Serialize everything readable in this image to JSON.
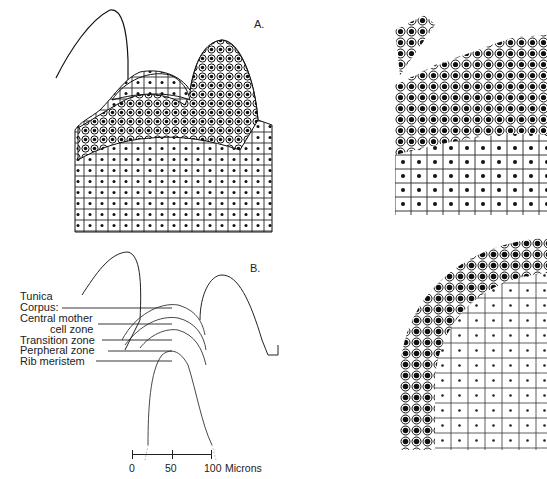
{
  "figure": {
    "panels": [
      {
        "id": "A",
        "label": "A.",
        "description": "Drawing of shoot apex section with cellular detail"
      },
      {
        "id": "B",
        "label": "B.",
        "description": "Outline diagram of shoot apex zones"
      }
    ],
    "zone_labels": [
      "Tunica",
      "Corpus:",
      "Central mother",
      "cell zone",
      "Transition zone",
      "Perpheral zone",
      "Rib meristem"
    ],
    "scale_bar": {
      "ticks": [
        "0",
        "50",
        "100"
      ],
      "unit": "Microns"
    },
    "right_panels": [
      {
        "id": "top-right",
        "description": "Enlarged cellular detail of apex, upper"
      },
      {
        "id": "bottom-right",
        "description": "Enlarged cellular detail of apex dome, lower"
      }
    ]
  }
}
